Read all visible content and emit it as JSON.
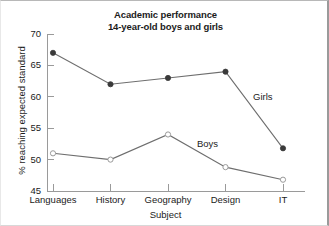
{
  "chart_data": {
    "type": "line",
    "title": "Academic performance",
    "subtitle": "14-year-old boys and girls",
    "title_lines": [
      "Academic performance",
      "14-year-old boys and girls"
    ],
    "xlabel": "Subject",
    "ylabel": "% reaching expected standard",
    "categories": [
      "Languages",
      "History",
      "Geography",
      "Design",
      "IT"
    ],
    "ylim": [
      45,
      70
    ],
    "yticks": [
      45,
      50,
      55,
      60,
      65,
      70
    ],
    "ytick_labels": [
      "45",
      "50",
      "55",
      "60",
      "65",
      "70"
    ],
    "grid": false,
    "legend_position": "inline-annotation",
    "series": [
      {
        "name": "Girls",
        "marker": "filled-circle",
        "color": "#3a3a3a",
        "values": [
          67,
          62,
          63,
          64,
          51.8
        ]
      },
      {
        "name": "Boys",
        "marker": "open-circle",
        "color": "#9a9a9a",
        "values": [
          51,
          50,
          54,
          48.8,
          46.8
        ]
      }
    ],
    "annotations": [
      {
        "text": "Girls",
        "series": "Girls"
      },
      {
        "text": "Boys",
        "series": "Boys"
      }
    ]
  },
  "figure": {
    "background": "#ffffff",
    "axis_color": "#9a9a9a",
    "text_color": "#1b1b1b"
  }
}
